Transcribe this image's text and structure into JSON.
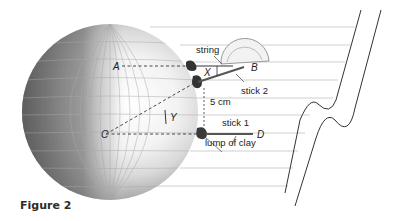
{
  "figure": {
    "caption": "Figure 2",
    "labels": {
      "string": "string",
      "stick2": "stick 2",
      "stick1": "stick 1",
      "distance": "5 cm",
      "clay": "lump of clay"
    },
    "points": {
      "A": "A",
      "B": "B",
      "C": "C",
      "D": "D",
      "X": "X",
      "Y": "Y"
    },
    "colors": {
      "ray_line": "#c8c8c8",
      "sphere_dark": "#6a6a6a",
      "sphere_light": "#f4f4f4",
      "stick": "#555555",
      "clay": "#3a3a3a"
    }
  }
}
